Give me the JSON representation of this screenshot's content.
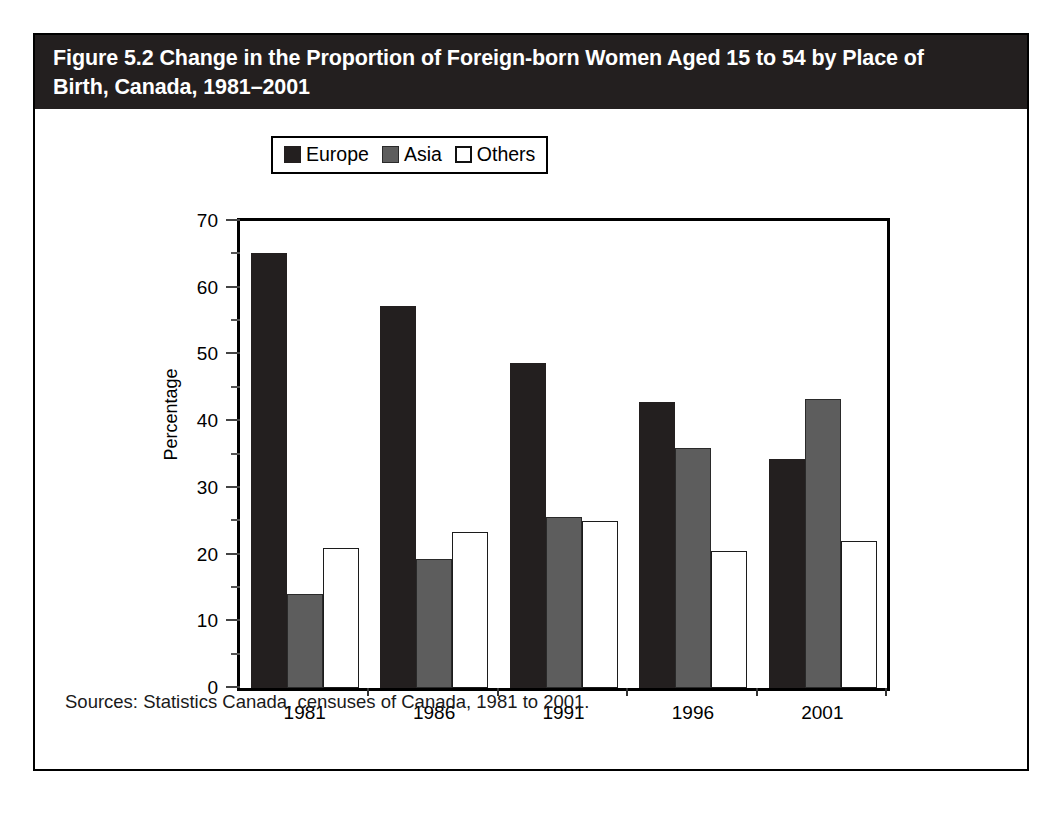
{
  "figure": {
    "title": "Figure 5.2 Change in the Proportion of Foreign-born Women Aged 15 to 54 by Place of\nBirth, Canada, 1981–2001",
    "source_note": "Sources: Statistics Canada, censuses of Canada, 1981 to 2001.",
    "title_bg_color": "#231f1f",
    "title_text_color": "#ffffff",
    "border_color": "#000000"
  },
  "chart_data": {
    "type": "bar",
    "title": "Figure 5.2 Change in the Proportion of Foreign-born Women Aged 15 to 54 by Place of Birth, Canada, 1981–2001",
    "xlabel": "",
    "ylabel": "Percentage",
    "categories": [
      "1981",
      "1986",
      "1991",
      "1996",
      "2001"
    ],
    "series": [
      {
        "name": "Europe",
        "color": "#231f1f",
        "values": [
          65.2,
          57.2,
          48.7,
          42.8,
          34.4
        ]
      },
      {
        "name": "Asia",
        "color": "#5d5d5d",
        "values": [
          14.1,
          19.4,
          25.6,
          36.0,
          43.3
        ]
      },
      {
        "name": "Others",
        "color": "#ffffff",
        "values": [
          21.0,
          23.4,
          25.1,
          20.6,
          22.0
        ]
      }
    ],
    "ylim": [
      0,
      70
    ],
    "ytick_labels": [
      "0",
      "10",
      "20",
      "30",
      "40",
      "50",
      "60",
      "70"
    ],
    "ytick_values": [
      0,
      10,
      20,
      30,
      40,
      50,
      60,
      70
    ],
    "yminor_values": [
      5,
      15,
      25,
      35,
      45,
      55,
      65
    ],
    "grid": false,
    "legend_position": "upper center",
    "legend_entries": [
      "Europe",
      "Asia",
      "Others"
    ]
  }
}
